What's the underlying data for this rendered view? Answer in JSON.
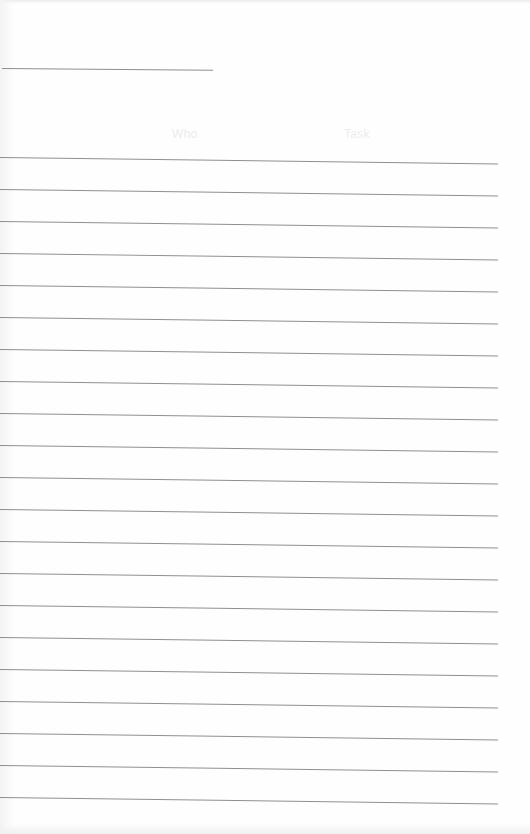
{
  "page": {
    "type": "ruled-log-sheet",
    "background": "#fefefe",
    "line_color": "#8f8f8f"
  },
  "title_line": {
    "value": ""
  },
  "header": {
    "columns": [
      {
        "label": "Who"
      },
      {
        "label": "Task"
      }
    ]
  },
  "rows": {
    "count": 21,
    "spacing_px": 32,
    "first_top_px": 157,
    "entries": [
      "",
      "",
      "",
      "",
      "",
      "",
      "",
      "",
      "",
      "",
      "",
      "",
      "",
      "",
      "",
      "",
      "",
      "",
      "",
      "",
      ""
    ]
  }
}
